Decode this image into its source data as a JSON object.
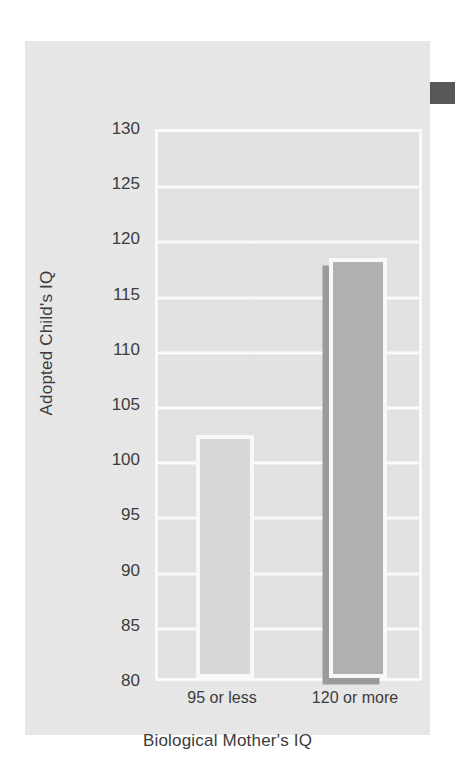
{
  "chart_data": {
    "type": "bar",
    "title": "",
    "subtitle": "",
    "xlabel": "Biological Mother's IQ",
    "ylabel": "Adopted Child's IQ",
    "categories": [
      "95 or less",
      "120 or more"
    ],
    "values": [
      102,
      118
    ],
    "ylim": [
      80,
      130
    ],
    "ytick_step": 5,
    "yticks": [
      130,
      125,
      120,
      115,
      110,
      105,
      100,
      95,
      90,
      85,
      80
    ],
    "ytick_labels": [
      "130",
      "125",
      "120",
      "115",
      "110",
      "105",
      "100",
      "95",
      "90",
      "85",
      "80"
    ],
    "grid": true,
    "grid_color": "#fdfdfd",
    "legend": false,
    "legend_position": "none",
    "annotations": [],
    "bars": [
      {
        "category": "95 or less",
        "value": 102,
        "fill_color": "#dadada",
        "border_color": "#fbfbfb",
        "shadow": false
      },
      {
        "category": "120 or more",
        "value": 118,
        "fill_color": "#b2b2b2",
        "border_color": "#fbfbfb",
        "shadow": true,
        "shadow_color": "#9b9b9b"
      }
    ]
  },
  "figure": {
    "panel_color": "#e9e9e9",
    "plot_color": "#e4e4e4",
    "page_color": "#ffffff",
    "text_color": "#3b3b3b"
  },
  "artifacts": {
    "edge_block_color": "#585858"
  }
}
